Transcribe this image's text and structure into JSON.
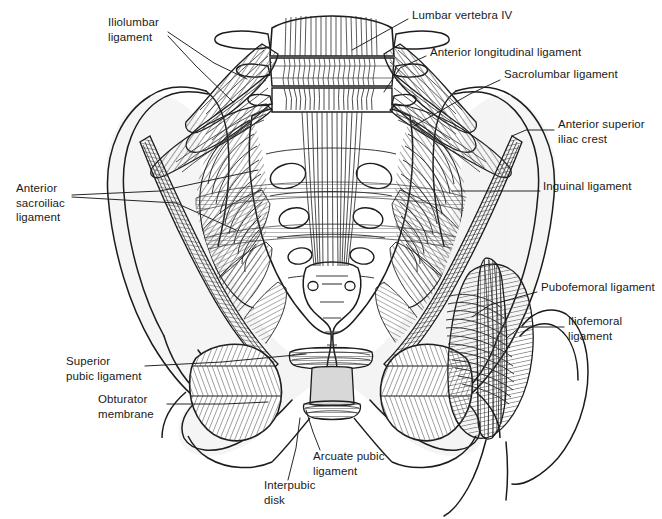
{
  "figure": {
    "background_color": "#ffffff",
    "ink_color": "#1a1a1a",
    "shading_color": "#6e6e6e",
    "width": 662,
    "height": 519
  },
  "labels": [
    {
      "id": "iliolumbar-ligament",
      "lines": [
        "Iliolumbar",
        "ligament"
      ],
      "x": 108,
      "y": 21,
      "align": "left"
    },
    {
      "id": "lumbar-vertebra-iv",
      "lines": [
        "Lumbar vertebra IV"
      ],
      "x": 412,
      "y": 14,
      "align": "left"
    },
    {
      "id": "anterior-longitudinal-ligament",
      "lines": [
        "Anterior longitudinal ligament"
      ],
      "x": 430,
      "y": 51,
      "align": "left"
    },
    {
      "id": "sacrolumbar-ligament",
      "lines": [
        "Sacrolumbar ligament"
      ],
      "x": 504,
      "y": 73,
      "align": "left"
    },
    {
      "id": "anterior-superior-iliac-crest",
      "lines": [
        "Anterior superior",
        "iliac crest"
      ],
      "x": 558,
      "y": 123,
      "align": "left"
    },
    {
      "id": "anterior-sacroiliac-ligament",
      "lines": [
        "Anterior",
        "sacroiliac",
        "ligament"
      ],
      "x": 16,
      "y": 187,
      "align": "left"
    },
    {
      "id": "inguinal-ligament",
      "lines": [
        "Inguinal ligament"
      ],
      "x": 543,
      "y": 185,
      "align": "left"
    },
    {
      "id": "pubofemoral-ligament",
      "lines": [
        "Pubofemoral ligament"
      ],
      "x": 541,
      "y": 286,
      "align": "left"
    },
    {
      "id": "iliofemoral-ligament",
      "lines": [
        "Iliofemoral",
        "ligament"
      ],
      "x": 568,
      "y": 320,
      "align": "left"
    },
    {
      "id": "superior-pubic-ligament",
      "lines": [
        "Superior",
        "pubic ligament"
      ],
      "x": 66,
      "y": 360,
      "align": "left"
    },
    {
      "id": "obturator-membrane",
      "lines": [
        "Obturator",
        "membrane"
      ],
      "x": 98,
      "y": 398,
      "align": "left"
    },
    {
      "id": "arcuate-pubic-ligament",
      "lines": [
        "Arcuate pubic",
        "ligament"
      ],
      "x": 313,
      "y": 455,
      "align": "left"
    },
    {
      "id": "interpubic-disk",
      "lines": [
        "Interpubic",
        "disk"
      ],
      "x": 264,
      "y": 484,
      "align": "left"
    }
  ],
  "leader_lines": [
    {
      "id": "leader-iliolumbar-a",
      "points": "168,32 214,63 247,79"
    },
    {
      "id": "leader-iliolumbar-b",
      "points": "168,36 196,66 233,102"
    },
    {
      "id": "leader-lumbar-vertebra",
      "points": "408,19 352,50"
    },
    {
      "id": "leader-anterior-longitudinal",
      "points": "426,56 400,68 384,92"
    },
    {
      "id": "leader-sacrolumbar",
      "points": "500,80 470,94 414,126"
    },
    {
      "id": "leader-asis",
      "points": "554,130 526,130 512,136"
    },
    {
      "id": "leader-sacroiliac-a",
      "points": "72,195 160,191 258,170"
    },
    {
      "id": "leader-sacroiliac-b",
      "points": "72,197 176,203 236,230"
    },
    {
      "id": "leader-inguinal",
      "points": "540,191 452,191"
    },
    {
      "id": "leader-pubofemoral",
      "points": "537,292 490,305 472,317"
    },
    {
      "id": "leader-iliofemoral",
      "points": "564,327 520,327 508,337"
    },
    {
      "id": "leader-superior-pubic",
      "points": "145,366 222,362 306,354"
    },
    {
      "id": "leader-obturator",
      "points": "167,404 224,404 268,402"
    },
    {
      "id": "leader-arcuate",
      "points": "320,450 313,432 306,410"
    },
    {
      "id": "leader-interpubic",
      "points": "288,480 296,448 300,418"
    }
  ],
  "anatomy_parts": [
    "left ilium",
    "right ilium",
    "sacrum",
    "coccyx",
    "lumbar vertebra IV body",
    "transverse processes",
    "left obturator foramen with obturator membrane",
    "right obturator foramen with obturator membrane",
    "pubic symphysis with interpubic disk",
    "right femur head and neck",
    "greater trochanter"
  ]
}
